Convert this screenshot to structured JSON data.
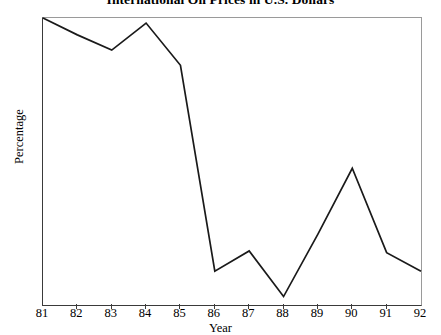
{
  "chart_data": {
    "type": "line",
    "title": "International Oil Prices in U.S. Dollars",
    "xlabel": "Year",
    "ylabel": "Percentage",
    "x": [
      "81",
      "82",
      "83",
      "84",
      "85",
      "86",
      "87",
      "88",
      "89",
      "90",
      "91",
      "92"
    ],
    "values": [
      30.0,
      29.0,
      28.1,
      29.7,
      27.2,
      15.0,
      16.2,
      13.5,
      17.2,
      21.1,
      16.1,
      15.0
    ],
    "categories": [
      "81",
      "82",
      "83",
      "84",
      "85",
      "86",
      "87",
      "88",
      "89",
      "90",
      "91",
      "92"
    ],
    "xlim": [
      81,
      92
    ],
    "ylim": [
      13,
      30
    ],
    "y_ticks": [
      30,
      29,
      28,
      27,
      26,
      25,
      24,
      23,
      22,
      21,
      20,
      19,
      18,
      17,
      16,
      15,
      14,
      13
    ],
    "x_ticks": [
      "81",
      "82",
      "83",
      "84",
      "85",
      "86",
      "87",
      "88",
      "89",
      "90",
      "91",
      "92"
    ],
    "grid": false,
    "legend": false,
    "series": [
      {
        "name": "International Oil Prices in U.S. Dollars",
        "values": [
          30.0,
          29.0,
          28.1,
          29.7,
          27.2,
          15.0,
          16.2,
          13.5,
          17.2,
          21.1,
          16.1,
          15.0
        ],
        "color": "#1a1a1a"
      }
    ],
    "line_color": "#1a1a1a",
    "axis_color": "#3a3a3a",
    "background_color": "#ffffff"
  }
}
